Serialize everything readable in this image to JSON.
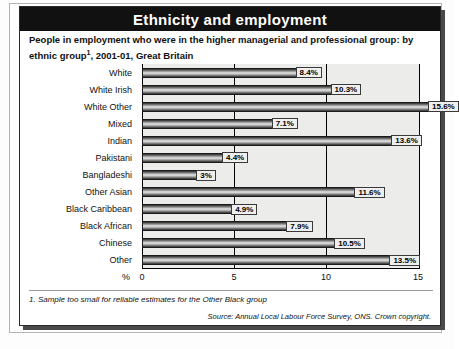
{
  "header": {
    "title": "Ethnicity and employment"
  },
  "subtitle": {
    "line1": "People in employment who were in the higher managerial and professional group: by ethnic",
    "footnote_marker": "1",
    "line2": "group",
    "line2_rest": ", 2001-01, Great Britain"
  },
  "footnote": "1. Sample too small for reliable estimates for the Other Black group",
  "source": "Source: Annual Local Labour Force Survey, ONS. Crown copyright.",
  "axis": {
    "unit_label": "%",
    "ticks": [
      "0",
      "5",
      "10",
      "15"
    ]
  },
  "chart_data": {
    "type": "bar",
    "orientation": "horizontal",
    "title": "Ethnicity and employment",
    "subtitle": "People in employment who were in the higher managerial and professional group: by ethnic group, 2001-01, Great Britain",
    "xlabel": "%",
    "ylabel": "",
    "xlim": [
      0,
      15
    ],
    "xticks": [
      0,
      5,
      10,
      15
    ],
    "grid": true,
    "legend": false,
    "categories": [
      "White",
      "White Irish",
      "White Other",
      "Mixed",
      "Indian",
      "Pakistani",
      "Bangladeshi",
      "Other Asian",
      "Black Caribbean",
      "Black African",
      "Chinese",
      "Other"
    ],
    "values": [
      8.4,
      10.3,
      15.6,
      7.1,
      13.6,
      4.4,
      3.0,
      11.6,
      4.9,
      7.9,
      10.5,
      13.5
    ],
    "value_labels": [
      "8.4%",
      "10.3%",
      "15.6%",
      "7.1%",
      "13.6%",
      "4.4%",
      "3%",
      "11.6%",
      "4.9%",
      "7.9%",
      "10.5%",
      "13.5%"
    ],
    "colors": {
      "plot_background": "#ececeb",
      "bar_dark": "#2b2b2b",
      "bar_light": "#e8e8e8",
      "title_band": "#111111",
      "title_text": "#ffffff"
    }
  }
}
